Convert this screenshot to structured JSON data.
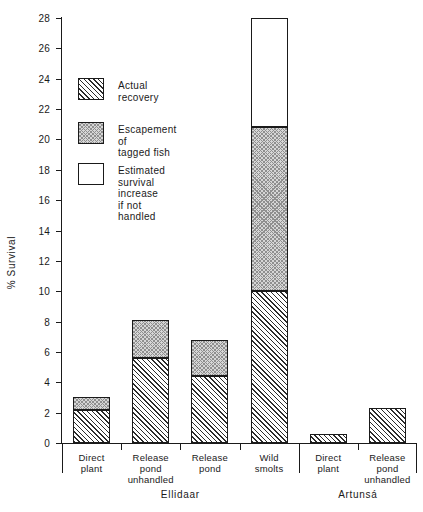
{
  "chart_data": {
    "type": "bar",
    "title": "",
    "xlabel": "",
    "ylabel": "% Survival",
    "ylim": [
      0,
      28
    ],
    "ytick_step": 2,
    "yticks": [
      "0",
      "2",
      "4",
      "6",
      "8",
      "10",
      "12",
      "14",
      "16",
      "18",
      "20",
      "22",
      "24",
      "26",
      "28"
    ],
    "grid": false,
    "stacked": true,
    "legend_position": "upper-left-inside",
    "categories": [
      "Direct\nplant",
      "Release\npond\nunhandled",
      "Release\npond",
      "Wild\nsmolts",
      "Direct\nplant",
      "Release\npond\nunhandled"
    ],
    "groups": [
      {
        "label": "Ellidaar",
        "categories": [
          0,
          1,
          2,
          3
        ]
      },
      {
        "label": "Artunsá",
        "categories": [
          4,
          5
        ]
      }
    ],
    "series": [
      {
        "name": "Actual recovery",
        "fill": "hatch",
        "values": [
          2.2,
          5.6,
          4.4,
          10.0,
          0.6,
          2.3
        ]
      },
      {
        "name": "Escapement of tagged fish",
        "fill": "checker",
        "values": [
          0.8,
          2.5,
          2.4,
          10.8,
          0.0,
          0.0
        ]
      },
      {
        "name": "Estimated survival increase if not handled",
        "fill": "open",
        "values": [
          0.0,
          0.0,
          0.0,
          7.2,
          0.0,
          0.0
        ]
      }
    ],
    "totals": [
      3.0,
      8.1,
      6.8,
      28.0,
      0.6,
      2.3
    ]
  },
  "legend": {
    "items": [
      {
        "label": "Actual recovery",
        "fill": "hatch"
      },
      {
        "label": "Escapement of\ntagged fish",
        "fill": "checker"
      },
      {
        "label": "Estimated survival\nincrease if not handled",
        "fill": "open"
      }
    ]
  },
  "axis": {
    "y_title": "% Survival"
  },
  "artifacts": {
    "top_cropped_text": ""
  }
}
